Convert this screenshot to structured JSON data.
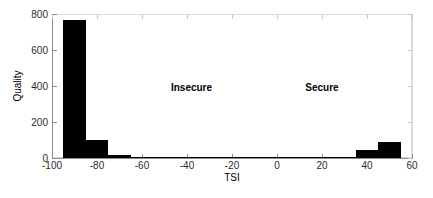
{
  "chart_data": {
    "type": "bar",
    "title": "",
    "subtitle": "",
    "xlabel": "TSI",
    "ylabel": "Quality",
    "xlim": [
      -100,
      60
    ],
    "ylim": [
      0,
      800
    ],
    "grid": false,
    "legend": null,
    "bin_width": 10,
    "xticks": [
      -100,
      -80,
      -60,
      -40,
      -20,
      0,
      20,
      40,
      60
    ],
    "xtick_labels": [
      "-100",
      "-80",
      "-60",
      "-40",
      "-20",
      "0",
      "20",
      "40",
      "60"
    ],
    "yticks": [
      0,
      200,
      400,
      600,
      800
    ],
    "ytick_labels": [
      "0",
      "200",
      "400",
      "600",
      "800"
    ],
    "bar_color": "#000000",
    "bins": [
      {
        "x0": -95,
        "x1": -85,
        "value": 765
      },
      {
        "x0": -85,
        "x1": -75,
        "value": 100
      },
      {
        "x0": -75,
        "x1": -65,
        "value": 18
      },
      {
        "x0": -65,
        "x1": -55,
        "value": 6
      },
      {
        "x0": -55,
        "x1": -45,
        "value": 2
      },
      {
        "x0": -45,
        "x1": -35,
        "value": 1
      },
      {
        "x0": -35,
        "x1": -25,
        "value": 1
      },
      {
        "x0": -25,
        "x1": -15,
        "value": 3
      },
      {
        "x0": -15,
        "x1": -5,
        "value": 2
      },
      {
        "x0": -5,
        "x1": 5,
        "value": 2
      },
      {
        "x0": 5,
        "x1": 15,
        "value": 2
      },
      {
        "x0": 15,
        "x1": 25,
        "value": 2
      },
      {
        "x0": 25,
        "x1": 35,
        "value": 4
      },
      {
        "x0": 35,
        "x1": 45,
        "value": 45
      },
      {
        "x0": 45,
        "x1": 55,
        "value": 90
      }
    ],
    "annotations": [
      {
        "text": "Insecure",
        "x": -38,
        "y": 390
      },
      {
        "text": "Secure",
        "x": 20,
        "y": 390
      }
    ]
  }
}
